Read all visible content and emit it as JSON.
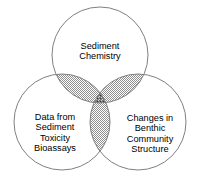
{
  "diagram": {
    "type": "venn-3-circle",
    "background_color": "#ffffff",
    "stroke_color": "#808080",
    "pair_overlap_fill": "#a9a9a9",
    "triple_overlap_fill": "#6f6f6f",
    "text_color": "#000000",
    "circles": [
      {
        "id": "top",
        "name": "sediment-chemistry",
        "label": "Sediment\nChemistry",
        "label_lines": [
          "Sediment",
          "Chemistry"
        ],
        "cx": 100,
        "cy": 55,
        "r": 48
      },
      {
        "id": "left",
        "name": "sediment-toxicity-bioassays",
        "label": "Data from\nSediment\nToxicity\nBioassays",
        "label_lines": [
          "Data from",
          "Sediment",
          "Toxicity",
          "Bioassays"
        ],
        "cx": 62,
        "cy": 122,
        "r": 48
      },
      {
        "id": "right",
        "name": "benthic-community-structure",
        "label": "Changes in\nBenthic\nCommunity\nStructure",
        "label_lines": [
          "Changes in",
          "Benthic",
          "Community",
          "Structure"
        ],
        "cx": 138,
        "cy": 122,
        "r": 48
      }
    ]
  }
}
